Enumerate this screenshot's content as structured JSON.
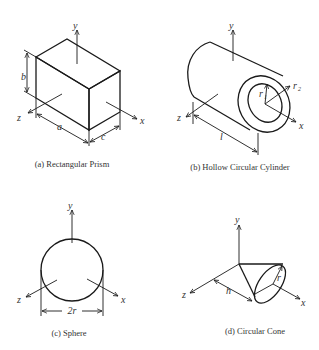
{
  "figures": {
    "a": {
      "caption": "(a) Rectangular Prism",
      "labels": {
        "y": "y",
        "z": "z",
        "x": "x",
        "a": "a",
        "b": "b",
        "c": "c"
      }
    },
    "b": {
      "caption": "(b) Hollow Circular Cylinder",
      "labels": {
        "y": "y",
        "z": "z",
        "x": "x",
        "l": "l",
        "r1": "r",
        "r1_sub": "1",
        "r2": "r",
        "r2_sub": "2"
      }
    },
    "c": {
      "caption": "(c) Sphere",
      "labels": {
        "y": "y",
        "z": "z",
        "x": "x",
        "diameter": "2r"
      }
    },
    "d": {
      "caption": "(d) Circular Cone",
      "labels": {
        "y": "y",
        "z": "z",
        "x": "x",
        "h": "h",
        "r": "r"
      }
    }
  },
  "colors": {
    "line": "#1a1a1a",
    "text": "#333333",
    "background": "#ffffff"
  }
}
